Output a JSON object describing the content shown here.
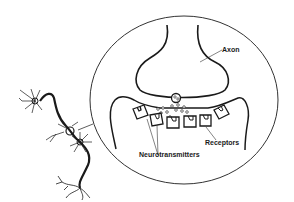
{
  "diagram": {
    "type": "synapse illustration",
    "labels": {
      "axon": "Axon",
      "receptors": "Receptors",
      "neurotransmitters": "Neurotransmitters"
    },
    "colors": {
      "line": "#1a1a1a",
      "background": "#ffffff"
    }
  }
}
